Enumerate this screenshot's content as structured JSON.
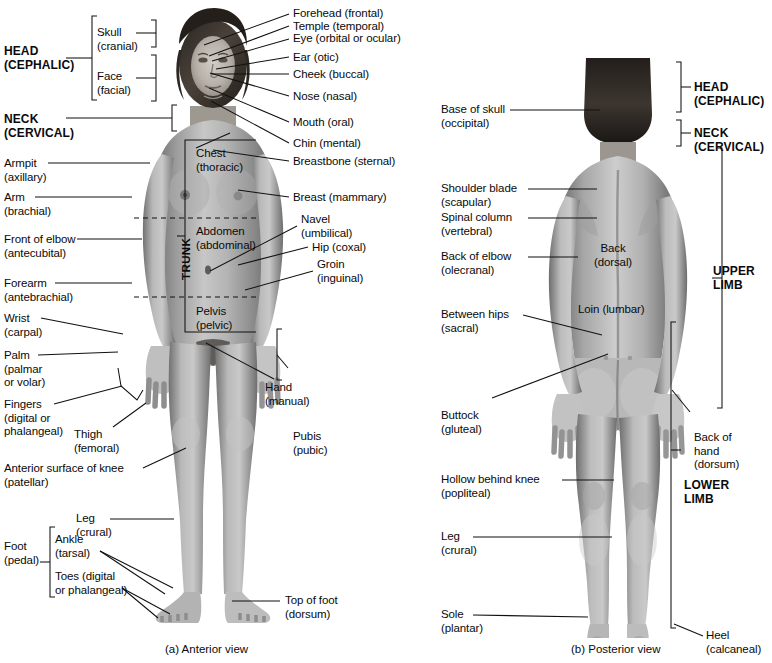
{
  "document": {
    "type": "anatomical-diagram",
    "subject": "Regional terms of the human body",
    "background_color": "#ffffff",
    "text_color": "#0a0a0a",
    "line_color": "#111111"
  },
  "captions": {
    "anterior": "(a) Anterior view",
    "posterior": "(b) Posterior view"
  },
  "anterior": {
    "major_regions": [
      {
        "key": "head",
        "label": "HEAD\n(CEPHALIC)"
      },
      {
        "key": "neck",
        "label": "NECK\n(CERVICAL)"
      },
      {
        "key": "trunk",
        "label": "TRUNK"
      }
    ],
    "subregions": [
      {
        "key": "skull",
        "label": "Skull\n(cranial)"
      },
      {
        "key": "face",
        "label": "Face\n(facial)"
      },
      {
        "key": "foot",
        "label": "Foot\n(pedal)"
      }
    ],
    "trunk_divisions": [
      {
        "key": "chest",
        "label": "Chest\n(thoracic)"
      },
      {
        "key": "abdomen",
        "label": "Abdomen\n(abdominal)"
      },
      {
        "key": "pelvis",
        "label": "Pelvis\n(pelvic)"
      }
    ],
    "right_labels": [
      {
        "key": "forehead",
        "label": "Forehead (frontal)"
      },
      {
        "key": "temple",
        "label": "Temple (temporal)"
      },
      {
        "key": "eye",
        "label": "Eye (orbital or ocular)"
      },
      {
        "key": "ear",
        "label": "Ear (otic)"
      },
      {
        "key": "cheek",
        "label": "Cheek (buccal)"
      },
      {
        "key": "nose",
        "label": "Nose (nasal)"
      },
      {
        "key": "mouth",
        "label": "Mouth (oral)"
      },
      {
        "key": "chin",
        "label": "Chin (mental)"
      },
      {
        "key": "breastbone",
        "label": "Breastbone (sternal)"
      },
      {
        "key": "breast",
        "label": "Breast (mammary)"
      },
      {
        "key": "navel",
        "label": "Navel\n(umbilical)"
      },
      {
        "key": "hip",
        "label": "Hip (coxal)"
      },
      {
        "key": "groin",
        "label": "Groin\n(inguinal)"
      },
      {
        "key": "hand",
        "label": "Hand\n(manual)"
      },
      {
        "key": "pubis",
        "label": "Pubis\n(pubic)"
      },
      {
        "key": "topoffoot",
        "label": "Top of foot\n(dorsum)"
      }
    ],
    "left_labels": [
      {
        "key": "armpit",
        "label": "Armpit\n(axillary)"
      },
      {
        "key": "arm",
        "label": "Arm\n(brachial)"
      },
      {
        "key": "frontofelbow",
        "label": "Front of elbow\n(antecubital)"
      },
      {
        "key": "forearm",
        "label": "Forearm\n(antebrachial)"
      },
      {
        "key": "wrist",
        "label": "Wrist\n(carpal)"
      },
      {
        "key": "palm",
        "label": "Palm\n(palmar\nor volar)"
      },
      {
        "key": "fingers",
        "label": "Fingers\n(digital or\nphalangeal)"
      },
      {
        "key": "thigh",
        "label": "Thigh\n(femoral)"
      },
      {
        "key": "knee",
        "label": "Anterior surface of knee\n(patellar)"
      },
      {
        "key": "leg",
        "label": "Leg\n(crural)"
      },
      {
        "key": "ankle",
        "label": "Ankle\n(tarsal)"
      },
      {
        "key": "toes",
        "label": "Toes (digital\nor phalangeal)"
      }
    ]
  },
  "posterior": {
    "major_regions": [
      {
        "key": "head",
        "label": "HEAD\n(CEPHALIC)"
      },
      {
        "key": "neck",
        "label": "NECK\n(CERVICAL)"
      },
      {
        "key": "upper_limb",
        "label": "UPPER\nLIMB"
      },
      {
        "key": "lower_limb",
        "label": "LOWER\nLIMB"
      }
    ],
    "left_labels": [
      {
        "key": "baseofskull",
        "label": "Base of skull\n(occipital)"
      },
      {
        "key": "shoulderblade",
        "label": "Shoulder blade\n(scapular)"
      },
      {
        "key": "spinalcolumn",
        "label": "Spinal column\n(vertebral)"
      },
      {
        "key": "backofelbow",
        "label": "Back of elbow\n(olecranal)"
      },
      {
        "key": "betweenhips",
        "label": "Between hips\n(sacral)"
      },
      {
        "key": "buttock",
        "label": "Buttock\n(gluteal)"
      },
      {
        "key": "hollowknee",
        "label": "Hollow behind knee\n(popliteal)"
      },
      {
        "key": "leg",
        "label": "Leg\n(crural)"
      },
      {
        "key": "sole",
        "label": "Sole\n(plantar)"
      }
    ],
    "center_labels": [
      {
        "key": "back",
        "label": "Back\n(dorsal)"
      },
      {
        "key": "loin",
        "label": "Loin (lumbar)"
      }
    ],
    "right_labels": [
      {
        "key": "backofhand",
        "label": "Back of\nhand\n(dorsum)"
      },
      {
        "key": "heel",
        "label": "Heel\n(calcaneal)"
      }
    ]
  }
}
